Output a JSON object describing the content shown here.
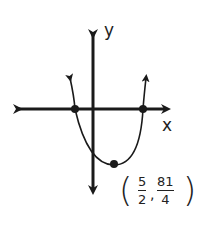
{
  "diagram": {
    "type": "parabola-graph",
    "axes": {
      "x_label": "x",
      "y_label": "y"
    },
    "curve": {
      "equation_shape": "upward-opening parabola",
      "x_intercepts": [
        "left root",
        "right root"
      ]
    },
    "vertex_label": {
      "open": "(",
      "x_num": "5",
      "x_den": "2",
      "sep": ",",
      "y_num": "81",
      "y_den": "4",
      "close": ")"
    },
    "colors": {
      "stroke": "#1a1a1a"
    }
  }
}
